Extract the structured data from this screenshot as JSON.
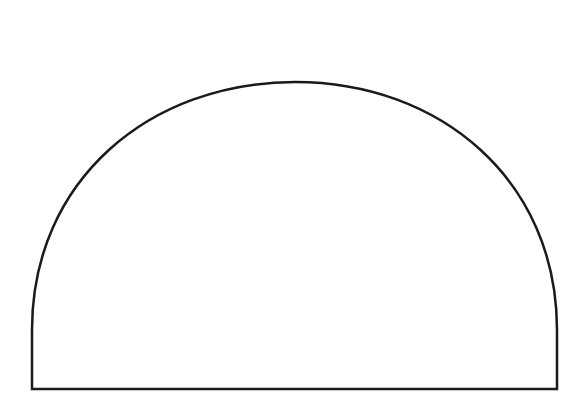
{
  "diagram": {
    "shape": "semicircle",
    "stroke_color": "#1a1a1a",
    "fill_color": "#ffffff",
    "background": "#ffffff",
    "stroke_width": 2.5,
    "base": {
      "x1": 32,
      "x2": 557,
      "y": 389
    },
    "apex": {
      "x": 295,
      "y": 82
    },
    "side_top_y": 330
  }
}
